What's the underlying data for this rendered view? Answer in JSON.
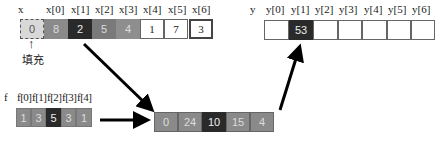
{
  "x_array": {
    "name": "x",
    "labels": [
      "x[0]",
      "x[1]",
      "x[2]",
      "x[3]",
      "x[4]",
      "x[5]",
      "x[6]"
    ],
    "pad_value": "0",
    "values": [
      "8",
      "2",
      "5",
      "4",
      "1",
      "7",
      "3"
    ],
    "colors": [
      "#8a8a8a",
      "#2a2a2a",
      "#7a7a7a",
      "#8e8e8e",
      "#ffffff",
      "#ffffff",
      "#ffffff"
    ],
    "pad_label": "填充"
  },
  "f_array": {
    "name": "f",
    "labels": [
      "f[0]",
      "f[1]",
      "f[2]",
      "f[3]",
      "f[4]"
    ],
    "values": [
      "1",
      "3",
      "5",
      "3",
      "1"
    ],
    "colors": [
      "#8a8a8a",
      "#8a8a8a",
      "#2a2a2a",
      "#8a8a8a",
      "#8a8a8a"
    ]
  },
  "product_array": {
    "values": [
      "0",
      "24",
      "10",
      "15",
      "4"
    ],
    "colors": [
      "#8a8a8a",
      "#8a8a8a",
      "#2a2a2a",
      "#8a8a8a",
      "#8a8a8a"
    ]
  },
  "y_array": {
    "name": "y",
    "labels": [
      "y[0]",
      "y[1]",
      "y[2]",
      "y[3]",
      "y[4]",
      "y[5]",
      "y[6]"
    ],
    "values": [
      "",
      "53",
      "",
      "",
      "",
      "",
      ""
    ],
    "colors": [
      "#ffffff",
      "#2a2a2a",
      "#ffffff",
      "#ffffff",
      "#ffffff",
      "#ffffff",
      "#ffffff"
    ]
  }
}
